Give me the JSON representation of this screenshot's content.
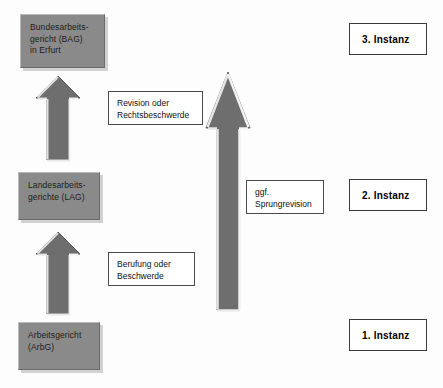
{
  "diagram": {
    "colors": {
      "box_fill": "#8a8a8a",
      "box_shadow": "#d2d2d2",
      "arrow_fill": "#6e6e6e",
      "arrow_highlight": "#e8e8e8",
      "arrow_outline": "#585858",
      "label_border": "#4a4a4a",
      "page_background": "#fdfdfd"
    },
    "courts": [
      {
        "id": "bag",
        "lines": [
          "Bundesarbeits-",
          "gericht (BAG)",
          "in Erfurt"
        ],
        "instance": "3. Instanz"
      },
      {
        "id": "lag",
        "lines": [
          "Landesarbeits-",
          "gerichte (LAG)"
        ],
        "instance": "2. Instanz"
      },
      {
        "id": "arbg",
        "lines": [
          "Arbeitsgericht",
          "(ArbG)"
        ],
        "instance": "1. Instanz"
      }
    ],
    "appeals": [
      {
        "id": "revision",
        "lines": [
          "Revision oder",
          "Rechtsbeschwerde"
        ],
        "from": "lag",
        "to": "bag"
      },
      {
        "id": "berufung",
        "lines": [
          "Berufung oder",
          "Beschwerde"
        ],
        "from": "arbg",
        "to": "lag"
      },
      {
        "id": "sprungrevision",
        "lines": [
          "ggf.",
          "Sprungrevision"
        ],
        "from": "arbg",
        "to": "bag"
      }
    ],
    "instances": [
      {
        "id": "instanz3",
        "label": "3. Instanz"
      },
      {
        "id": "instanz2",
        "label": "2. Instanz"
      },
      {
        "id": "instanz1",
        "label": "1. Instanz"
      }
    ]
  }
}
